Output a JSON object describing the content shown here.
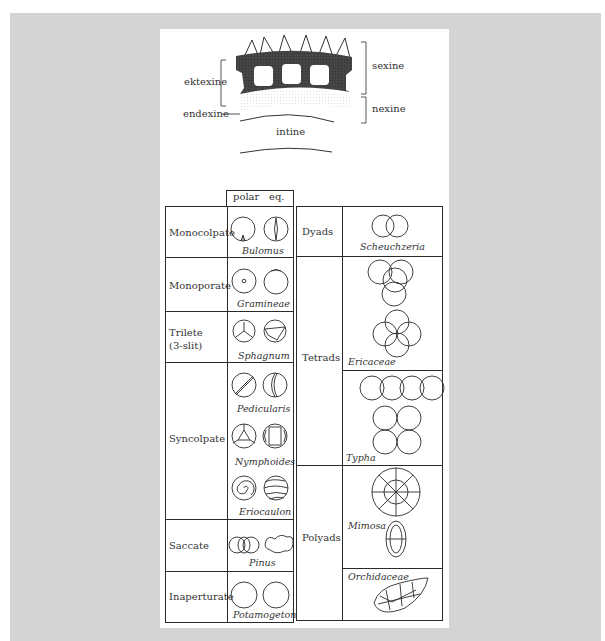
{
  "wall_diagram": {
    "labels": {
      "ektexine": "ektexine",
      "endexine": "endexine",
      "sexine": "sexine",
      "nexine": "nexine",
      "intine": "intine"
    }
  },
  "left_table": {
    "header": {
      "polar": "polar",
      "eq": "eq."
    },
    "rows": [
      {
        "category": "Monocolpate",
        "species": [
          "Bulomus"
        ]
      },
      {
        "category": "Monoporate",
        "species": [
          "Gramineae"
        ]
      },
      {
        "category": "Trilete (3-slit)",
        "category_line1": "Trilete",
        "category_line2": "(3-slit)",
        "species": [
          "Sphagnum"
        ]
      },
      {
        "category": "Syncolpate",
        "species": [
          "Pedicularis",
          "Nymphoides",
          "Eriocaulon"
        ]
      },
      {
        "category": "Saccate",
        "species": [
          "Pinus"
        ]
      },
      {
        "category": "Inaperturate",
        "species": [
          "Potamogeton"
        ]
      }
    ]
  },
  "right_table": {
    "rows": [
      {
        "category": "Dyads",
        "species": [
          "Scheuchzeria"
        ]
      },
      {
        "category": "Tetrads",
        "species": [
          "Ericaceae",
          "Typha"
        ]
      },
      {
        "category": "Polyads",
        "species": [
          "Mimosa",
          "Orchidaceae"
        ]
      }
    ]
  },
  "colors": {
    "background_frame": "#d4d4d4",
    "panel": "#ffffff",
    "ink": "#2a2a2a",
    "exine_fill": "#4a4a4a"
  }
}
